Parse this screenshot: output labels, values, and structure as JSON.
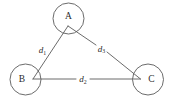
{
  "diagram": {
    "type": "undirected-graph-triangle",
    "background_color": "#ffffff",
    "stroke_color": "#5a5a5a",
    "text_color": "#2b2b2b",
    "nodes": [
      {
        "id": "A",
        "label": "A",
        "cx": 68.5,
        "cy": 18.5,
        "r": 15.5,
        "junction_x": 68.0,
        "junction_y": 26.0
      },
      {
        "id": "B",
        "label": "B",
        "cx": 25.5,
        "cy": 79.5,
        "r": 15.5,
        "junction_x": 33.0,
        "junction_y": 79.0
      },
      {
        "id": "C",
        "label": "C",
        "cx": 148.0,
        "cy": 79.5,
        "r": 15.5,
        "junction_x": 140.5,
        "junction_y": 79.0
      }
    ],
    "edges": [
      {
        "id": "edge-a-b",
        "from": "A",
        "to": "B",
        "label": "d",
        "subscript": "1",
        "label_x": 42.5,
        "label_y": 50.0,
        "gap": false
      },
      {
        "id": "edge-b-c",
        "from": "B",
        "to": "C",
        "label": "d",
        "subscript": "2",
        "label_x": 83.0,
        "label_y": 79.0,
        "gap": true
      },
      {
        "id": "edge-a-c",
        "from": "A",
        "to": "C",
        "label": "d",
        "subscript": "3",
        "label_x": 101.5,
        "label_y": 48.5,
        "gap": true
      }
    ]
  }
}
